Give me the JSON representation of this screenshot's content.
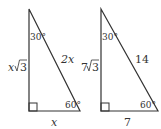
{
  "diagram": {
    "triangles": [
      {
        "name": "general",
        "top_angle": "30°",
        "bottom_right_angle": "60°",
        "vertical_side_base": "x",
        "vertical_side_radicand": "3",
        "hypotenuse": "2x",
        "base": "x"
      },
      {
        "name": "example",
        "top_angle": "30°",
        "bottom_right_angle": "60°",
        "vertical_side_base": "7",
        "vertical_side_radicand": "3",
        "hypotenuse": "14",
        "base": "7"
      }
    ],
    "line_color": "#333333"
  }
}
